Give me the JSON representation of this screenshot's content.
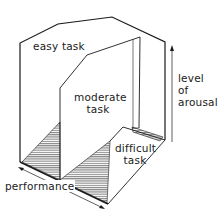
{
  "diagram": {
    "labels": {
      "easy_task": "easy task",
      "moderate_task_line1": "moderate",
      "moderate_task_line2": "task",
      "difficult_task_line1": "difficult",
      "difficult_task_line2": "task",
      "arousal_line1": "level",
      "arousal_line2": "of",
      "arousal_line3": "arousal",
      "performance": "performance"
    },
    "axes": {
      "vertical_axis": "level of arousal",
      "horizontal_axis": "performance"
    },
    "panels": [
      "easy task",
      "moderate task",
      "difficult task"
    ],
    "colors": {
      "line": "#1a1a1a",
      "hatch": "#555555",
      "background": "#ffffff"
    }
  }
}
